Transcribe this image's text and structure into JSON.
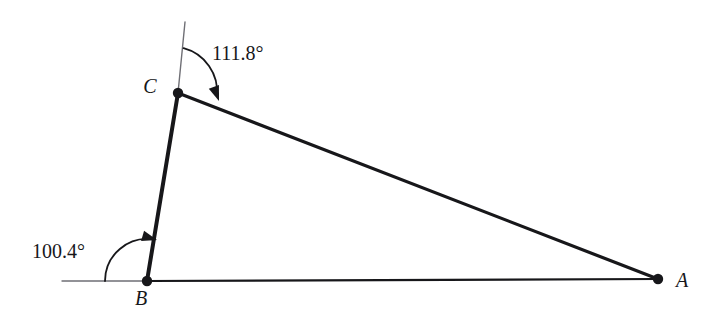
{
  "figure": {
    "background_color": "#ffffff",
    "ink_color": "#17171a",
    "thin_line_color": "#6f6f75",
    "width": 710,
    "height": 328
  },
  "vertices": {
    "a": {
      "label": "A",
      "x": 658,
      "y": 279,
      "label_x": 676,
      "label_y": 287
    },
    "b": {
      "label": "B",
      "x": 147,
      "y": 281,
      "label_x": 141,
      "label_y": 305
    },
    "c": {
      "label": "C",
      "x": 178,
      "y": 93,
      "label_x": 150,
      "label_y": 93
    }
  },
  "sides": [
    {
      "name": "side-bc",
      "from": "b",
      "to": "c",
      "stroke_width": 4
    },
    {
      "name": "side-ca",
      "from": "c",
      "to": "a",
      "stroke_width": 3.2
    },
    {
      "name": "side-ba",
      "from": "b",
      "to": "a",
      "stroke_width": 2.2
    }
  ],
  "extension_lines": [
    {
      "name": "extension-above-c",
      "x1": 185,
      "y1": 22,
      "x2": 178,
      "y2": 93
    },
    {
      "name": "extension-left-of-b",
      "x1": 62,
      "y1": 281,
      "x2": 147,
      "y2": 281
    }
  ],
  "angles": [
    {
      "name": "angle-at-c",
      "value": "111.8°",
      "vertex": "c",
      "radius": 45,
      "label_x": 212,
      "label_y": 60,
      "arc_path": "M 183.6 48.2 A 45 45 0 0 1 216.9 96.0",
      "arrow_tip_x": 219,
      "arrow_tip_y": 101,
      "arrow_angle_deg": 70
    },
    {
      "name": "angle-at-b",
      "value": "100.4°",
      "vertex": "b",
      "radius": 42,
      "label_x": 32,
      "label_y": 258,
      "arc_path": "M 105 281 A 42 42 0 0 1 153.9 239.6",
      "arrow_tip_x": 157,
      "arrow_tip_y": 240,
      "arrow_angle_deg": 16
    }
  ],
  "chart_data": {
    "type": "diagram",
    "shape": "triangle",
    "points": [
      {
        "id": "A",
        "x": 658,
        "y": 279
      },
      {
        "id": "B",
        "x": 147,
        "y": 281
      },
      {
        "id": "C",
        "x": 178,
        "y": 93
      }
    ],
    "edges": [
      {
        "from": "B",
        "to": "C"
      },
      {
        "from": "C",
        "to": "A"
      },
      {
        "from": "B",
        "to": "A"
      }
    ],
    "annotations": [
      {
        "at": "C",
        "text": "111.8°",
        "measured_from": "upward vertical extension through C",
        "to": "segment CA",
        "direction": "clockwise"
      },
      {
        "at": "B",
        "text": "100.4°",
        "measured_from": "horizontal reference line through B",
        "to": "segment BC",
        "direction": "counterclockwise"
      }
    ],
    "vertex_labels": [
      "A",
      "B",
      "C"
    ],
    "grid": false,
    "legend": false
  }
}
